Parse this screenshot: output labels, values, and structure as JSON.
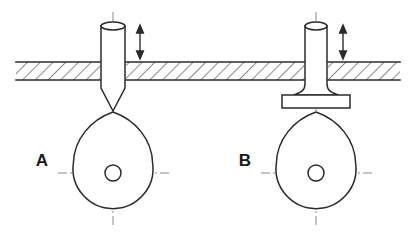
{
  "figure": {
    "width": 415,
    "height": 248,
    "background_color": "#ffffff",
    "line_color": "#2b2b2b",
    "centerline_color": "#8a8a8a",
    "hatch_color": "#2b2b2b"
  },
  "variants": [
    {
      "id": "A",
      "label": "A",
      "label_x": 42,
      "label_y": 166,
      "follower_type": "pointed-follower",
      "description": "Reciprocating rod with pointed (knife-edge) tip riding on the cam",
      "rod": {
        "left_x": 101,
        "right_x": 125,
        "top_y": 26,
        "body_bottom_y": 88,
        "tip_y": 111,
        "ellipse_cx": 113,
        "ellipse_cy": 26,
        "ellipse_rx": 12,
        "ellipse_ry": 4
      },
      "foot": null,
      "cam": {
        "center_x": 113,
        "center_y": 173,
        "radius": 40,
        "apex_x": 113,
        "apex_y": 112,
        "hole_radius": 8
      },
      "motion_arrow": {
        "x": 140,
        "top_y": 27,
        "bottom_y": 57,
        "type": "double-headed-vertical-arrow"
      }
    },
    {
      "id": "B",
      "label": "B",
      "label_x": 245,
      "label_y": 166,
      "follower_type": "flat-faced-follower",
      "description": "Reciprocating rod with flat mushroom plate face riding on the cam",
      "rod": {
        "left_x": 305,
        "right_x": 327,
        "top_y": 26,
        "body_bottom_y": 86,
        "tip_y": 95,
        "ellipse_cx": 316,
        "ellipse_cy": 26,
        "ellipse_rx": 11,
        "ellipse_ry": 4
      },
      "foot": {
        "left_x": 282,
        "right_x": 350,
        "top_y": 95,
        "bottom_y": 108,
        "fillet_radius": 10,
        "shape": "rectangular-plate"
      },
      "cam": {
        "center_x": 316,
        "center_y": 173,
        "radius": 40,
        "apex_x": 316,
        "apex_y": 112,
        "hole_radius": 8
      },
      "motion_arrow": {
        "x": 343,
        "top_y": 27,
        "bottom_y": 57,
        "type": "double-headed-vertical-arrow"
      }
    }
  ],
  "wall": {
    "name": "sectioned-guide-wall",
    "left_x": 16,
    "right_x": 400,
    "top_y": 62,
    "bottom_y": 80,
    "hatch_angle_deg": 45,
    "hatch_spacing": 9,
    "gaps": [
      {
        "from_x": 100,
        "to_x": 126
      },
      {
        "from_x": 304,
        "to_x": 328
      }
    ]
  },
  "centerlines": {
    "vertical": [
      {
        "x": 113,
        "top_y": 12,
        "bottom_y": 228
      },
      {
        "x": 316,
        "top_y": 12,
        "bottom_y": 228
      }
    ],
    "horizontal": [
      {
        "y": 173,
        "left_x": 58,
        "right_x": 170
      },
      {
        "y": 173,
        "left_x": 261,
        "right_x": 373
      }
    ],
    "style": "dash-dot"
  }
}
